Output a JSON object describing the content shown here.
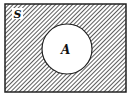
{
  "diagram": {
    "type": "venn",
    "universal_set": {
      "label": "S",
      "shaded": true
    },
    "sets": [
      {
        "label": "A",
        "shaded": false
      }
    ],
    "colors": {
      "border": "#222222",
      "hatch": "#333333",
      "background": "#ffffff"
    }
  }
}
